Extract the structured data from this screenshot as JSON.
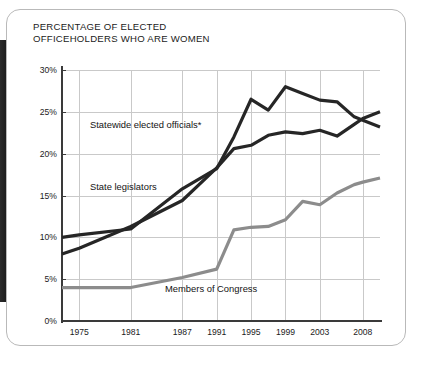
{
  "chart_data": {
    "type": "line",
    "title": "PERCENTAGE OF ELECTED\nOFFICEHOLDERS WHO ARE WOMEN",
    "xlabel": "",
    "ylabel": "",
    "ylim": [
      0,
      30
    ],
    "xlim": [
      1973,
      2010
    ],
    "grid": true,
    "legend_position": "inline-annotations",
    "ytick_labels": [
      "0%",
      "5%",
      "10%",
      "15%",
      "20%",
      "25%",
      "30%"
    ],
    "ytick_values": [
      0,
      5,
      10,
      15,
      20,
      25,
      30
    ],
    "xtick_labels": [
      "1975",
      "1981",
      "1987",
      "1991",
      "1995",
      "1999",
      "2003",
      "2008"
    ],
    "xtick_values": [
      1975,
      1981,
      1987,
      1991,
      1995,
      1999,
      2003,
      2008
    ],
    "series": [
      {
        "name": "Statewide elected officials*",
        "color": "#262626",
        "width": 3.2,
        "x": [
          1973,
          1975,
          1981,
          1987,
          1991,
          1993,
          1995,
          1997,
          1999,
          2001,
          2003,
          2005,
          2007,
          2008,
          2010
        ],
        "values": [
          10.0,
          10.3,
          11.0,
          15.8,
          18.2,
          22.0,
          26.5,
          25.2,
          28.0,
          27.2,
          26.4,
          26.2,
          24.4,
          24.0,
          23.2
        ]
      },
      {
        "name": "State legislators",
        "color": "#262626",
        "width": 3.2,
        "x": [
          1973,
          1975,
          1981,
          1987,
          1991,
          1993,
          1995,
          1997,
          1999,
          2001,
          2003,
          2005,
          2007,
          2008,
          2010
        ],
        "values": [
          8.0,
          8.7,
          11.3,
          14.4,
          18.3,
          20.6,
          21.0,
          22.2,
          22.6,
          22.4,
          22.8,
          22.1,
          23.5,
          24.2,
          25.0
        ]
      },
      {
        "name": "Members of Congress",
        "color": "#8c8c8c",
        "width": 3.2,
        "x": [
          1973,
          1975,
          1981,
          1987,
          1991,
          1993,
          1995,
          1997,
          1999,
          2001,
          2003,
          2005,
          2007,
          2008,
          2010
        ],
        "values": [
          4.0,
          4.0,
          4.0,
          5.2,
          6.2,
          10.9,
          11.2,
          11.3,
          12.1,
          14.3,
          13.9,
          15.3,
          16.3,
          16.6,
          17.1
        ]
      }
    ],
    "annotations": [
      {
        "text": "Statewide elected officials*",
        "name": "statewide"
      },
      {
        "text": "State legislators",
        "name": "legislators"
      },
      {
        "text": "Members of Congress",
        "name": "congress"
      }
    ]
  }
}
